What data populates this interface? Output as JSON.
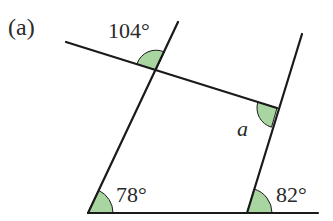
{
  "figure": {
    "part_label": "(a)",
    "angles": [
      {
        "id": "top-left-angle",
        "label": "104°"
      },
      {
        "id": "right-angle-a",
        "label": "a"
      },
      {
        "id": "bottom-left-angle",
        "label": "78°"
      },
      {
        "id": "bottom-right-angle",
        "label": "82°"
      }
    ],
    "colors": {
      "line": "#1a1a1a",
      "angle_fill": "#a8d5a0",
      "text": "#2a2a2a"
    }
  }
}
